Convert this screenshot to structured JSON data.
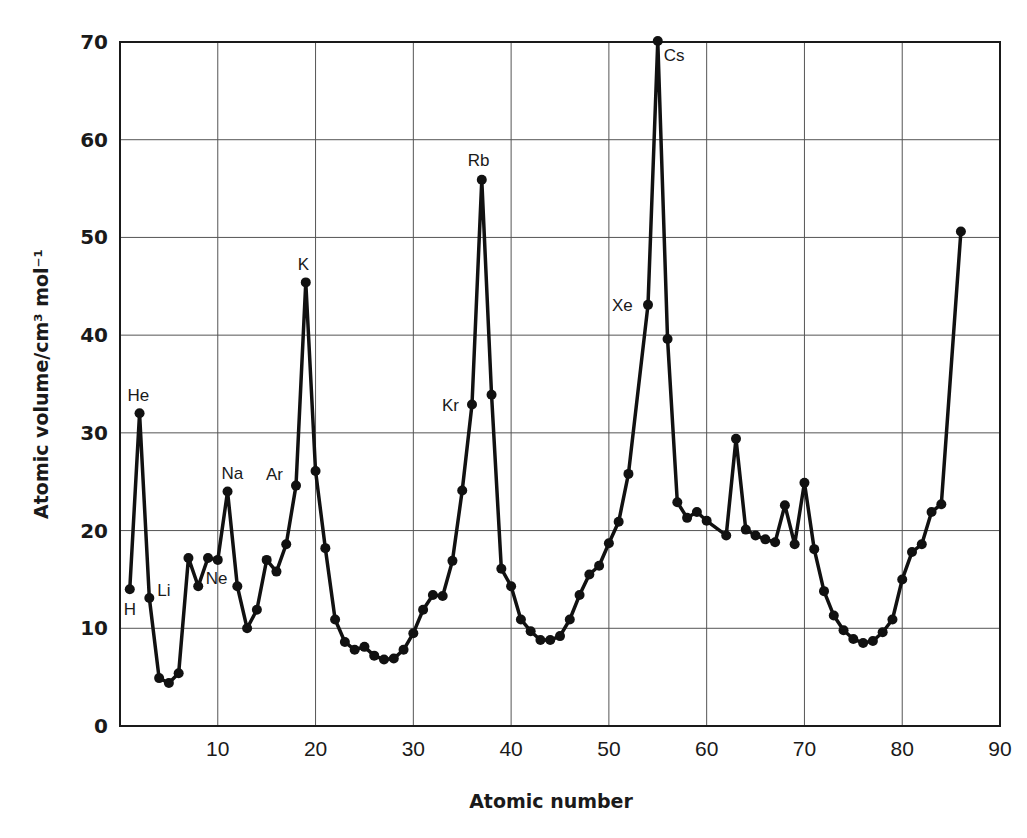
{
  "chart_data": {
    "type": "line",
    "title": "",
    "xlabel": "Atomic number",
    "ylabel": "Atomic volume/cm³ mol⁻¹",
    "xlim": [
      0,
      90
    ],
    "ylim": [
      0,
      70
    ],
    "xticks": [
      10,
      20,
      30,
      40,
      50,
      60,
      70,
      80,
      90
    ],
    "yticks": [
      0,
      10,
      20,
      30,
      40,
      50,
      60,
      70
    ],
    "grid": true,
    "legend": null,
    "series": [
      {
        "name": "Atomic volume",
        "color": "#111111",
        "points": [
          [
            1,
            14.0
          ],
          [
            2,
            32.0
          ],
          [
            3,
            13.1
          ],
          [
            4,
            4.9
          ],
          [
            5,
            4.4
          ],
          [
            6,
            5.4
          ],
          [
            7,
            17.2
          ],
          [
            8,
            14.3
          ],
          [
            9,
            17.2
          ],
          [
            10,
            17.0
          ],
          [
            11,
            24.0
          ],
          [
            12,
            14.3
          ],
          [
            13,
            10.0
          ],
          [
            14,
            11.9
          ],
          [
            15,
            17.0
          ],
          [
            16,
            15.8
          ],
          [
            17,
            18.6
          ],
          [
            18,
            24.6
          ],
          [
            19,
            45.4
          ],
          [
            20,
            26.1
          ],
          [
            21,
            18.2
          ],
          [
            22,
            10.9
          ],
          [
            23,
            8.6
          ],
          [
            24,
            7.8
          ],
          [
            25,
            8.1
          ],
          [
            26,
            7.2
          ],
          [
            27,
            6.8
          ],
          [
            28,
            6.9
          ],
          [
            29,
            7.8
          ],
          [
            30,
            9.5
          ],
          [
            31,
            11.9
          ],
          [
            32,
            13.4
          ],
          [
            33,
            13.3
          ],
          [
            34,
            16.9
          ],
          [
            35,
            24.1
          ],
          [
            36,
            32.9
          ],
          [
            37,
            55.9
          ],
          [
            38,
            33.9
          ],
          [
            39,
            16.1
          ],
          [
            40,
            14.3
          ],
          [
            41,
            10.9
          ],
          [
            42,
            9.7
          ],
          [
            43,
            8.8
          ],
          [
            44,
            8.8
          ],
          [
            45,
            9.2
          ],
          [
            46,
            10.9
          ],
          [
            47,
            13.4
          ],
          [
            48,
            15.5
          ],
          [
            49,
            16.4
          ],
          [
            50,
            18.7
          ],
          [
            51,
            20.9
          ],
          [
            52,
            25.8
          ],
          [
            54,
            43.1
          ],
          [
            55,
            70.1
          ],
          [
            56,
            39.6
          ],
          [
            57,
            22.9
          ],
          [
            58,
            21.3
          ],
          [
            59,
            21.9
          ],
          [
            60,
            21.0
          ],
          [
            62,
            19.5
          ],
          [
            63,
            29.4
          ],
          [
            64,
            20.1
          ],
          [
            65,
            19.5
          ],
          [
            66,
            19.1
          ],
          [
            67,
            18.8
          ],
          [
            68,
            22.6
          ],
          [
            69,
            18.6
          ],
          [
            70,
            24.9
          ],
          [
            71,
            18.1
          ],
          [
            72,
            13.8
          ],
          [
            73,
            11.3
          ],
          [
            74,
            9.8
          ],
          [
            75,
            8.9
          ],
          [
            76,
            8.5
          ],
          [
            77,
            8.7
          ],
          [
            78,
            9.6
          ],
          [
            79,
            10.9
          ],
          [
            80,
            15.0
          ],
          [
            81,
            17.8
          ],
          [
            82,
            18.6
          ],
          [
            83,
            21.9
          ],
          [
            84,
            22.7
          ],
          [
            86,
            50.6
          ]
        ]
      }
    ],
    "annotations": [
      {
        "text": "H",
        "x": 1,
        "y": 14.0,
        "dx": -6,
        "dy": 26
      },
      {
        "text": "He",
        "x": 2,
        "y": 32.0,
        "dx": -12,
        "dy": -12
      },
      {
        "text": "Li",
        "x": 3,
        "y": 13.1,
        "dx": 8,
        "dy": -2
      },
      {
        "text": "Ne",
        "x": 10,
        "y": 17.0,
        "dx": -12,
        "dy": 24
      },
      {
        "text": "Na",
        "x": 11,
        "y": 24.0,
        "dx": -6,
        "dy": -12
      },
      {
        "text": "Ar",
        "x": 18,
        "y": 24.6,
        "dx": -30,
        "dy": -6
      },
      {
        "text": "K",
        "x": 19,
        "y": 45.4,
        "dx": -8,
        "dy": -12
      },
      {
        "text": "Kr",
        "x": 36,
        "y": 32.9,
        "dx": -30,
        "dy": 6
      },
      {
        "text": "Rb",
        "x": 37,
        "y": 55.9,
        "dx": -14,
        "dy": -14
      },
      {
        "text": "Xe",
        "x": 54,
        "y": 43.1,
        "dx": -36,
        "dy": 6
      },
      {
        "text": "Cs",
        "x": 55,
        "y": 70.1,
        "dx": 6,
        "dy": 20
      }
    ]
  }
}
